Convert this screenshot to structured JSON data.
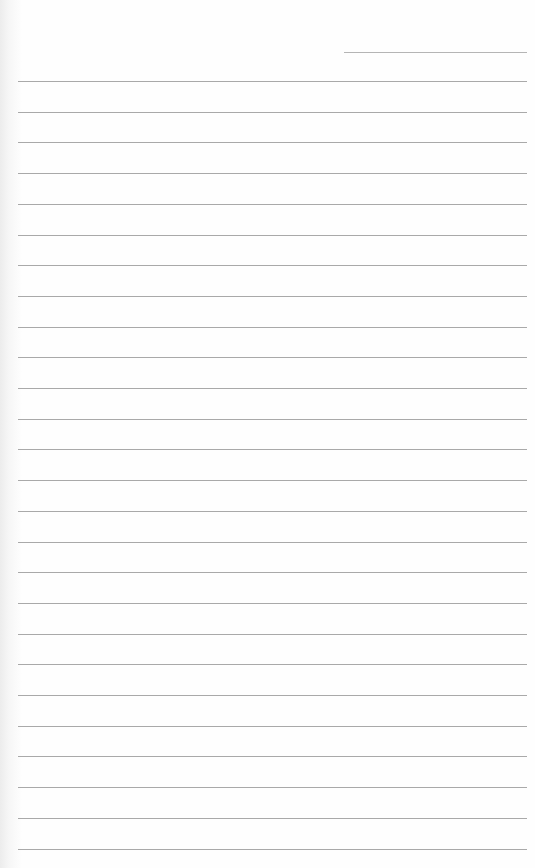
{
  "page": {
    "type": "blank lined notebook page",
    "background_color": "#fefefe",
    "rule_color": "#9a9a9a",
    "header_rule": {
      "y": 52,
      "x_start": 344,
      "x_end": 527
    },
    "rules": {
      "first_y": 81,
      "spacing": 30.7,
      "count": 26,
      "x_start": 18,
      "x_end": 527
    },
    "text": []
  }
}
